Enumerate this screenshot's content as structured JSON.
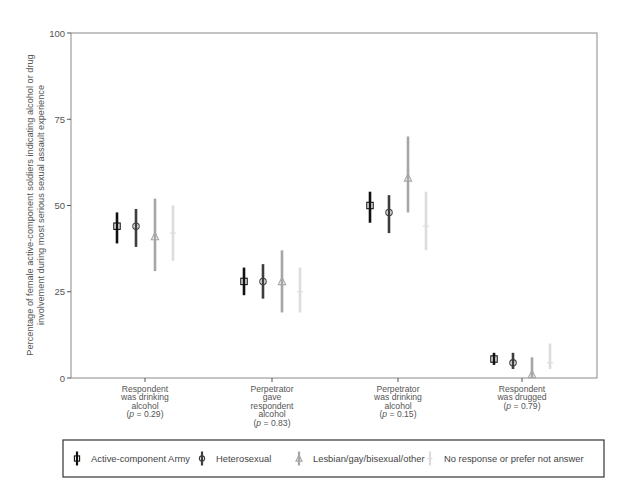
{
  "chart_data": {
    "type": "scatter",
    "subtype": "point-estimate-with-95pct-error-bars",
    "title": "",
    "ylabel": "Percentage of female active-component soldiers indicating alcohol or drug involvement during most serious sexual assault experience",
    "ylabel_lines": [
      "Percentage of female active-component soldiers indicating alcohol or drug",
      "involvement during most serious sexual assault experience"
    ],
    "xlabel": "",
    "ylim": [
      0,
      100
    ],
    "yticks": [
      0,
      25,
      50,
      75,
      100
    ],
    "grid": false,
    "legend_position": "bottom",
    "categories": [
      "Respondent was drinking alcohol (p = 0.29)",
      "Perpetrator gave respondent alcohol (p = 0.83)",
      "Perpetrator was drinking alcohol (p = 0.15)",
      "Respondent was drugged (p = 0.79)"
    ],
    "category_label_lines": [
      [
        "Respondent",
        "was drinking",
        "alcohol",
        "(p = 0.29)"
      ],
      [
        "Perpetrator",
        "gave",
        "respondent",
        "alcohol",
        "(p = 0.83)"
      ],
      [
        "Perpetrator",
        "was drinking",
        "alcohol",
        "(p = 0.15)"
      ],
      [
        "Respondent",
        "was drugged",
        "(p = 0.79)"
      ]
    ],
    "series": [
      {
        "name": "Active-component Army",
        "marker": "square",
        "color": "#111111",
        "values": [
          44,
          28,
          50,
          5.5
        ],
        "lower": [
          39,
          24,
          45,
          3.8
        ],
        "upper": [
          48,
          32,
          54,
          7.3
        ]
      },
      {
        "name": "Heterosexual",
        "marker": "circle",
        "color": "#3d3d3d",
        "values": [
          44,
          28,
          48,
          4.4
        ],
        "lower": [
          38,
          23,
          42,
          2.6
        ],
        "upper": [
          49,
          33,
          53,
          7.3
        ]
      },
      {
        "name": "Lesbian/gay/bisexual/other",
        "marker": "triangle",
        "color": "#a6a6a6",
        "values": [
          41,
          28,
          58,
          1
        ],
        "lower": [
          31,
          19,
          48,
          0
        ],
        "upper": [
          52,
          37,
          70,
          6
        ]
      },
      {
        "name": "No response or prefer not answer",
        "marker": "plus",
        "color": "#dcdcdc",
        "values": [
          42,
          25,
          44,
          4.4
        ],
        "lower": [
          34,
          19,
          37,
          2.6
        ],
        "upper": [
          50,
          32,
          54,
          10
        ]
      }
    ]
  },
  "legend": {
    "items": [
      {
        "label": "Active-component Army"
      },
      {
        "label": "Heterosexual"
      },
      {
        "label": "Lesbian/gay/bisexual/other"
      },
      {
        "label": "No response or prefer not answer"
      }
    ]
  }
}
